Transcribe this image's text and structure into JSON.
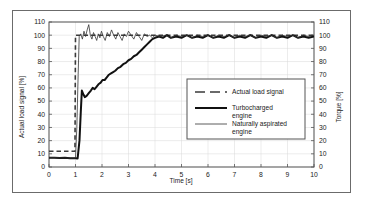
{
  "figure": {
    "frame_color": "#6b6b6b",
    "background": "#ffffff",
    "plot_border_color": "#555555",
    "grid_color": "#d9d9d9"
  },
  "chart_data": {
    "type": "line",
    "title": "",
    "xlabel": "Time [s]",
    "ylabel": "Actual load signal [%]",
    "y2label": "Torque [%]",
    "xlim": [
      0,
      10
    ],
    "ylim": [
      0,
      110
    ],
    "y2lim": [
      0,
      110
    ],
    "xticks": [
      "0",
      "1",
      "2",
      "3",
      "4",
      "5",
      "6",
      "7",
      "8",
      "9",
      "10"
    ],
    "yticks": [
      "0",
      "10",
      "20",
      "30",
      "40",
      "50",
      "60",
      "70",
      "80",
      "90",
      "100",
      "110"
    ],
    "y2ticks": [
      "0",
      "10",
      "20",
      "30",
      "40",
      "50",
      "60",
      "70",
      "80",
      "90",
      "100",
      "110"
    ],
    "grid": true,
    "legend_position": "center-right",
    "series": [
      {
        "name": "Actual load signal",
        "style": "dashed",
        "color": "#3a3a3a",
        "width": 1.6,
        "points": [
          [
            0,
            12
          ],
          [
            0.98,
            12
          ],
          [
            1.0,
            100
          ],
          [
            10,
            100
          ]
        ]
      },
      {
        "name": "Turbocharged engine",
        "style": "solid-thick",
        "color": "#111111",
        "width": 2.0,
        "points": [
          [
            0,
            7
          ],
          [
            0.2,
            7
          ],
          [
            0.4,
            6.8
          ],
          [
            0.6,
            7
          ],
          [
            0.8,
            6.6
          ],
          [
            1.0,
            6.6
          ],
          [
            1.08,
            6.5
          ],
          [
            1.15,
            20
          ],
          [
            1.2,
            42
          ],
          [
            1.24,
            58
          ],
          [
            1.3,
            55
          ],
          [
            1.35,
            53
          ],
          [
            1.42,
            54
          ],
          [
            1.5,
            56
          ],
          [
            1.58,
            58
          ],
          [
            1.65,
            60
          ],
          [
            1.72,
            59
          ],
          [
            1.8,
            61
          ],
          [
            1.88,
            63
          ],
          [
            1.95,
            64
          ],
          [
            2.02,
            66
          ],
          [
            2.1,
            66
          ],
          [
            2.18,
            68
          ],
          [
            2.26,
            70
          ],
          [
            2.34,
            71
          ],
          [
            2.42,
            72
          ],
          [
            2.5,
            73
          ],
          [
            2.6,
            75
          ],
          [
            2.7,
            76
          ],
          [
            2.8,
            78
          ],
          [
            2.9,
            79
          ],
          [
            3.0,
            81
          ],
          [
            3.1,
            82
          ],
          [
            3.2,
            84
          ],
          [
            3.3,
            85
          ],
          [
            3.4,
            87
          ],
          [
            3.5,
            89
          ],
          [
            3.6,
            91
          ],
          [
            3.7,
            93
          ],
          [
            3.8,
            95
          ],
          [
            3.9,
            97
          ],
          [
            4.0,
            98
          ],
          [
            4.15,
            99
          ],
          [
            4.3,
            98
          ],
          [
            4.45,
            100
          ],
          [
            4.6,
            98
          ],
          [
            4.8,
            99
          ],
          [
            5.0,
            98
          ],
          [
            5.2,
            100
          ],
          [
            5.4,
            98
          ],
          [
            5.6,
            99
          ],
          [
            5.8,
            98
          ],
          [
            6.0,
            100
          ],
          [
            6.2,
            98
          ],
          [
            6.4,
            99
          ],
          [
            6.6,
            98
          ],
          [
            6.8,
            100
          ],
          [
            7.0,
            98
          ],
          [
            7.2,
            99
          ],
          [
            7.4,
            98
          ],
          [
            7.6,
            100
          ],
          [
            7.8,
            98
          ],
          [
            8.0,
            99
          ],
          [
            8.2,
            98
          ],
          [
            8.4,
            100
          ],
          [
            8.6,
            98
          ],
          [
            8.8,
            99
          ],
          [
            9.0,
            98
          ],
          [
            9.2,
            100
          ],
          [
            9.4,
            98
          ],
          [
            9.6,
            99
          ],
          [
            9.8,
            98
          ],
          [
            10,
            99
          ]
        ]
      },
      {
        "name": "Naturally aspirated engine",
        "style": "solid-thin",
        "color": "#333333",
        "width": 0.8,
        "points": [
          [
            0,
            7
          ],
          [
            0.3,
            7
          ],
          [
            0.6,
            6.8
          ],
          [
            0.9,
            6.8
          ],
          [
            1.0,
            6.8
          ],
          [
            1.05,
            30
          ],
          [
            1.1,
            70
          ],
          [
            1.14,
            99
          ],
          [
            1.2,
            101
          ],
          [
            1.26,
            97
          ],
          [
            1.32,
            103
          ],
          [
            1.38,
            99
          ],
          [
            1.44,
            104
          ],
          [
            1.5,
            108
          ],
          [
            1.56,
            100
          ],
          [
            1.62,
            97
          ],
          [
            1.68,
            102
          ],
          [
            1.74,
            99
          ],
          [
            1.8,
            96
          ],
          [
            1.86,
            101
          ],
          [
            1.92,
            98
          ],
          [
            1.98,
            103
          ],
          [
            2.05,
            99
          ],
          [
            2.12,
            96
          ],
          [
            2.2,
            102
          ],
          [
            2.28,
            99
          ],
          [
            2.36,
            104
          ],
          [
            2.44,
            100
          ],
          [
            2.52,
            97
          ],
          [
            2.6,
            102
          ],
          [
            2.68,
            99
          ],
          [
            2.76,
            96
          ],
          [
            2.84,
            101
          ],
          [
            2.92,
            99
          ],
          [
            3.0,
            103
          ],
          [
            3.1,
            100
          ],
          [
            3.2,
            97
          ],
          [
            3.3,
            102
          ],
          [
            3.4,
            99
          ],
          [
            3.5,
            96
          ],
          [
            3.6,
            101
          ],
          [
            3.7,
            99
          ],
          [
            3.8,
            100
          ],
          [
            3.9,
            98
          ],
          [
            4.0,
            100
          ],
          [
            4.2,
            99
          ],
          [
            4.4,
            100
          ],
          [
            4.6,
            98
          ],
          [
            4.8,
            100
          ],
          [
            5.0,
            99
          ],
          [
            5.2,
            100
          ],
          [
            5.4,
            98
          ],
          [
            5.6,
            100
          ],
          [
            5.8,
            99
          ],
          [
            6.0,
            100
          ],
          [
            6.2,
            98
          ],
          [
            6.4,
            100
          ],
          [
            6.6,
            99
          ],
          [
            6.8,
            100
          ],
          [
            7.0,
            98
          ],
          [
            7.2,
            100
          ],
          [
            7.4,
            99
          ],
          [
            7.6,
            100
          ],
          [
            7.8,
            98
          ],
          [
            8.0,
            100
          ],
          [
            8.2,
            99
          ],
          [
            8.4,
            100
          ],
          [
            8.6,
            98
          ],
          [
            8.8,
            100
          ],
          [
            9.0,
            99
          ],
          [
            9.2,
            100
          ],
          [
            9.4,
            98
          ],
          [
            9.6,
            100
          ],
          [
            9.8,
            99
          ],
          [
            10,
            100
          ]
        ]
      }
    ],
    "legend": [
      {
        "label": "Actual load signal",
        "style": "dashed"
      },
      {
        "label": "Turbocharged engine",
        "style": "solid-thick"
      },
      {
        "label": "Naturally aspirated engine",
        "style": "solid-thin"
      }
    ]
  }
}
